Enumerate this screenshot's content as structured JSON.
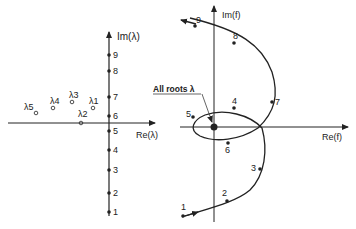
{
  "left_plot": {
    "title": "lambda-plane",
    "y_axis_label": "Im(λ)",
    "x_axis_label": "Re(λ)",
    "axis_points": [
      "1",
      "2",
      "3",
      "4",
      "5",
      "6",
      "7",
      "8",
      "9"
    ],
    "roots": [
      {
        "label": "λ1"
      },
      {
        "label": "λ2"
      },
      {
        "label": "λ3"
      },
      {
        "label": "λ4"
      },
      {
        "label": "λ5"
      }
    ]
  },
  "right_plot": {
    "title": "f-plane",
    "y_axis_label": "Im(f)",
    "x_axis_label": "Re(f)",
    "curve_points": [
      "1",
      "2",
      "3",
      "4",
      "5",
      "6",
      "7",
      "8",
      "9"
    ],
    "annotation": "All roots λ"
  },
  "colors": {
    "ink": "#222222",
    "background": "#ffffff"
  }
}
